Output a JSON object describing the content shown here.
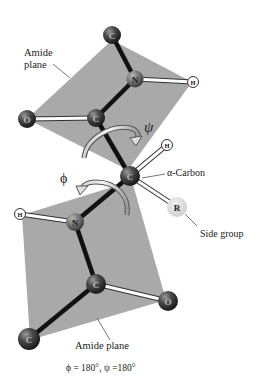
{
  "colors": {
    "plane": "#a9a9a9",
    "bond_backbone": "#111111",
    "atom_dark": "#3a3a3a",
    "atom_n": "#6a6a6a",
    "atom_h": "#ffffff",
    "side_group": "#d6d6d6",
    "label": "#222222"
  },
  "labels": {
    "amide_plane_top_line1": "Amide",
    "amide_plane_top_line2": "plane",
    "amide_plane_bottom": "Amide plane",
    "alpha_carbon": "α-Carbon",
    "side_group": "Side group",
    "psi": "ψ",
    "phi": "ϕ",
    "caption": "ϕ = 180°, ψ =180°"
  },
  "atoms": [
    {
      "id": "c_top",
      "symbol": "C",
      "x": 112,
      "y": 35
    },
    {
      "id": "n_top",
      "symbol": "N",
      "x": 135,
      "y": 79
    },
    {
      "id": "h_top",
      "symbol": "H",
      "x": 193,
      "y": 82
    },
    {
      "id": "c_carbonyl_top",
      "symbol": "C",
      "x": 96,
      "y": 118
    },
    {
      "id": "o_top",
      "symbol": "O",
      "x": 27,
      "y": 119
    },
    {
      "id": "c_alpha",
      "symbol": "C",
      "x": 130,
      "y": 176
    },
    {
      "id": "h_alpha",
      "symbol": "H",
      "x": 167,
      "y": 145
    },
    {
      "id": "r_side",
      "symbol": "R",
      "x": 177,
      "y": 207
    },
    {
      "id": "n_bottom",
      "symbol": "N",
      "x": 75,
      "y": 222
    },
    {
      "id": "h_bottom",
      "symbol": "H",
      "x": 20,
      "y": 214
    },
    {
      "id": "c_carbonyl_bottom",
      "symbol": "C",
      "x": 96,
      "y": 284
    },
    {
      "id": "o_bottom",
      "symbol": "O",
      "x": 168,
      "y": 301
    },
    {
      "id": "c_bottom",
      "symbol": "C",
      "x": 29,
      "y": 339
    }
  ]
}
